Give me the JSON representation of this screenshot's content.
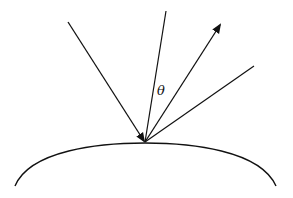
{
  "diagram": {
    "type": "reflection-at-curved-surface",
    "labels": {
      "angle": "θ"
    },
    "elements": [
      {
        "name": "incident-ray",
        "from": [
          68,
          22
        ],
        "to": [
          145,
          142
        ],
        "arrow": "end"
      },
      {
        "name": "normal-line",
        "from": [
          166,
          11
        ],
        "to": [
          145,
          142
        ],
        "arrow": "none"
      },
      {
        "name": "reflected-ray",
        "from": [
          145,
          142
        ],
        "to": [
          221,
          23
        ],
        "arrow": "end"
      },
      {
        "name": "outer-ray",
        "from": [
          145,
          142
        ],
        "to": [
          254,
          66
        ],
        "arrow": "none"
      },
      {
        "name": "curved-surface",
        "shape": "arc",
        "from": [
          15,
          186
        ],
        "apex": [
          145,
          143
        ],
        "to": [
          276,
          186
        ]
      }
    ],
    "colors": {
      "stroke": "#111111",
      "background": "#ffffff"
    }
  }
}
